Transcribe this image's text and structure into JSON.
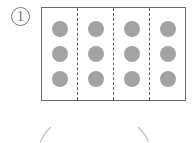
{
  "page": {
    "width": 195,
    "height": 143,
    "background": "#ffffff"
  },
  "item": {
    "number_label": "1",
    "number_style": "circled",
    "marker_color": "#7a7a7a"
  },
  "group_box": {
    "name": "partitioned-rectangle",
    "border_color": "#6b6b6b",
    "fill": "#ffffff",
    "divider_color": "#5f5f5f",
    "divider_style": "dashed",
    "divider_count": 3,
    "partition_count": 4
  },
  "dots": {
    "color": "#a3a3a3",
    "shape": "circle",
    "rows": 3,
    "columns": 4,
    "per_partition": 3,
    "total": 12
  },
  "partitions": [
    {
      "label": "group-1",
      "dot_count": 3
    },
    {
      "label": "group-2",
      "dot_count": 3
    },
    {
      "label": "group-3",
      "dot_count": 3
    },
    {
      "label": "group-4",
      "dot_count": 3
    }
  ],
  "annotations": {
    "brace_color": "#bdbdbd",
    "left_stroke": "diagonal-up-right",
    "right_stroke": "diagonal-down-right"
  }
}
